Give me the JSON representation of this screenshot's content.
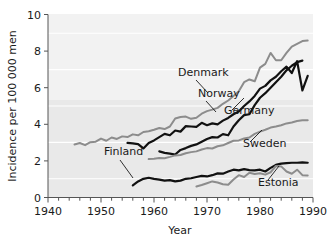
{
  "chart_data": {
    "type": "line",
    "title": "",
    "xlabel": "Year",
    "ylabel": "Incidence per 100 000 men",
    "xlim": [
      1940,
      1990
    ],
    "ylim": [
      0,
      10
    ],
    "xticks": [
      1940,
      1950,
      1960,
      1970,
      1980,
      1990
    ],
    "yticks": [
      0,
      2,
      4,
      6,
      8,
      10
    ],
    "xtick_labels": [
      "1940",
      "1950",
      "1960",
      "1970",
      "1980",
      "1990"
    ],
    "ytick_labels": [
      "0",
      "2",
      "4",
      "6",
      "8",
      "10"
    ],
    "xminor_step": 2,
    "grid": "horizontal-white-gridlines",
    "legend": "inline-labels-with-leader-lines",
    "series": [
      {
        "name": "Denmark",
        "color": "#8c8c8c",
        "label": "Denmark",
        "label_x": 178,
        "label_y": 76,
        "leader": [
          [
            196,
            80
          ],
          [
            208,
            93
          ]
        ],
        "points": [
          [
            1945,
            2.9
          ],
          [
            1946,
            2.98
          ],
          [
            1947,
            2.86
          ],
          [
            1948,
            3.02
          ],
          [
            1949,
            3.05
          ],
          [
            1950,
            3.22
          ],
          [
            1951,
            3.1
          ],
          [
            1952,
            3.28
          ],
          [
            1953,
            3.2
          ],
          [
            1954,
            3.34
          ],
          [
            1955,
            3.3
          ],
          [
            1956,
            3.45
          ],
          [
            1957,
            3.4
          ],
          [
            1958,
            3.58
          ],
          [
            1959,
            3.62
          ],
          [
            1960,
            3.7
          ],
          [
            1961,
            3.8
          ],
          [
            1962,
            3.74
          ],
          [
            1963,
            3.88
          ],
          [
            1964,
            4.32
          ],
          [
            1965,
            4.4
          ],
          [
            1966,
            4.42
          ],
          [
            1967,
            4.3
          ],
          [
            1968,
            4.36
          ],
          [
            1969,
            4.58
          ],
          [
            1970,
            4.72
          ],
          [
            1971,
            4.8
          ],
          [
            1972,
            4.9
          ],
          [
            1973,
            5.12
          ],
          [
            1974,
            5.3
          ],
          [
            1975,
            5.55
          ],
          [
            1976,
            5.8
          ],
          [
            1977,
            6.3
          ],
          [
            1978,
            6.45
          ],
          [
            1979,
            6.35
          ],
          [
            1980,
            7.1
          ],
          [
            1981,
            7.3
          ],
          [
            1982,
            7.9
          ],
          [
            1983,
            7.5
          ],
          [
            1984,
            7.5
          ],
          [
            1985,
            7.9
          ],
          [
            1986,
            8.25
          ],
          [
            1987,
            8.4
          ],
          [
            1988,
            8.55
          ],
          [
            1989,
            8.58
          ]
        ]
      },
      {
        "name": "Norway",
        "color": "#111111",
        "label": "Norway",
        "label_x": 198,
        "label_y": 97,
        "leader": [
          [
            206,
            101
          ],
          [
            216,
            112
          ]
        ],
        "points": [
          [
            1955,
            2.98
          ],
          [
            1956,
            2.96
          ],
          [
            1957,
            2.92
          ],
          [
            1958,
            2.68
          ],
          [
            1959,
            2.98
          ],
          [
            1960,
            3.12
          ],
          [
            1961,
            3.3
          ],
          [
            1962,
            3.48
          ],
          [
            1963,
            3.4
          ],
          [
            1964,
            3.66
          ],
          [
            1965,
            3.6
          ],
          [
            1966,
            3.9
          ],
          [
            1967,
            3.88
          ],
          [
            1968,
            3.86
          ],
          [
            1969,
            4.08
          ],
          [
            1970,
            3.95
          ],
          [
            1971,
            4.05
          ],
          [
            1972,
            4.0
          ],
          [
            1973,
            4.2
          ],
          [
            1974,
            4.35
          ],
          [
            1975,
            4.55
          ],
          [
            1976,
            4.7
          ],
          [
            1977,
            5.0
          ],
          [
            1978,
            5.25
          ],
          [
            1979,
            5.55
          ],
          [
            1980,
            5.95
          ],
          [
            1981,
            6.1
          ],
          [
            1982,
            6.4
          ],
          [
            1983,
            6.6
          ],
          [
            1984,
            6.9
          ],
          [
            1985,
            7.15
          ],
          [
            1986,
            6.8
          ],
          [
            1987,
            7.45
          ],
          [
            1988,
            5.85
          ],
          [
            1989,
            6.65
          ]
        ]
      },
      {
        "name": "Germany",
        "color": "#111111",
        "label": "Germany",
        "label_x": 224,
        "label_y": 114,
        "leader": [
          [
            232,
            110
          ],
          [
            244,
            98
          ]
        ],
        "points": [
          [
            1961,
            2.52
          ],
          [
            1962,
            2.44
          ],
          [
            1963,
            2.4
          ],
          [
            1964,
            2.35
          ],
          [
            1965,
            2.6
          ],
          [
            1966,
            2.7
          ],
          [
            1967,
            2.82
          ],
          [
            1968,
            2.9
          ],
          [
            1969,
            3.05
          ],
          [
            1970,
            3.2
          ],
          [
            1971,
            3.3
          ],
          [
            1972,
            3.28
          ],
          [
            1973,
            3.46
          ],
          [
            1974,
            3.4
          ],
          [
            1975,
            3.88
          ],
          [
            1976,
            4.22
          ],
          [
            1977,
            4.5
          ],
          [
            1978,
            4.55
          ],
          [
            1979,
            5.05
          ],
          [
            1980,
            5.45
          ],
          [
            1981,
            5.7
          ],
          [
            1982,
            6.0
          ],
          [
            1983,
            6.3
          ],
          [
            1984,
            6.6
          ],
          [
            1985,
            6.95
          ],
          [
            1986,
            7.2
          ],
          [
            1987,
            7.4
          ],
          [
            1988,
            7.48
          ]
        ]
      },
      {
        "name": "Finland",
        "color": "#111111",
        "label": "Finland",
        "label_x": 104,
        "label_y": 155,
        "leader": [
          [
            120,
            160
          ],
          [
            133,
            178
          ]
        ],
        "points": [
          [
            1956,
            0.66
          ],
          [
            1957,
            0.88
          ],
          [
            1958,
            1.02
          ],
          [
            1959,
            1.08
          ],
          [
            1960,
            1.02
          ],
          [
            1961,
            0.98
          ],
          [
            1962,
            0.92
          ],
          [
            1963,
            0.95
          ],
          [
            1964,
            0.88
          ],
          [
            1965,
            0.92
          ],
          [
            1966,
            1.02
          ],
          [
            1967,
            1.05
          ],
          [
            1968,
            1.12
          ],
          [
            1969,
            1.18
          ],
          [
            1970,
            1.15
          ],
          [
            1971,
            1.22
          ],
          [
            1972,
            1.32
          ],
          [
            1973,
            1.3
          ],
          [
            1974,
            1.42
          ],
          [
            1975,
            1.52
          ],
          [
            1976,
            1.48
          ],
          [
            1977,
            1.55
          ],
          [
            1978,
            1.5
          ],
          [
            1979,
            1.48
          ],
          [
            1980,
            1.52
          ],
          [
            1981,
            1.42
          ],
          [
            1982,
            1.62
          ],
          [
            1983,
            1.78
          ],
          [
            1984,
            1.85
          ],
          [
            1985,
            1.88
          ],
          [
            1986,
            1.9
          ],
          [
            1987,
            1.9
          ],
          [
            1988,
            1.92
          ],
          [
            1989,
            1.9
          ]
        ]
      },
      {
        "name": "Sweden",
        "color": "#8c8c8c",
        "label": "Sweden",
        "label_x": 243,
        "label_y": 147,
        "leader": [
          [
            250,
            142
          ],
          [
            262,
            130
          ]
        ],
        "points": [
          [
            1959,
            2.1
          ],
          [
            1960,
            2.12
          ],
          [
            1961,
            2.16
          ],
          [
            1962,
            2.15
          ],
          [
            1963,
            2.22
          ],
          [
            1964,
            2.3
          ],
          [
            1965,
            2.32
          ],
          [
            1966,
            2.42
          ],
          [
            1967,
            2.48
          ],
          [
            1968,
            2.52
          ],
          [
            1969,
            2.62
          ],
          [
            1970,
            2.7
          ],
          [
            1971,
            2.68
          ],
          [
            1972,
            2.8
          ],
          [
            1973,
            2.85
          ],
          [
            1974,
            2.98
          ],
          [
            1975,
            3.1
          ],
          [
            1976,
            3.12
          ],
          [
            1977,
            3.22
          ],
          [
            1978,
            3.28
          ],
          [
            1979,
            3.48
          ],
          [
            1980,
            3.6
          ],
          [
            1981,
            3.7
          ],
          [
            1982,
            3.82
          ],
          [
            1983,
            3.88
          ],
          [
            1984,
            3.95
          ],
          [
            1985,
            4.05
          ],
          [
            1986,
            4.1
          ],
          [
            1987,
            4.18
          ],
          [
            1988,
            4.22
          ],
          [
            1989,
            4.22
          ]
        ]
      },
      {
        "name": "Estonia",
        "color": "#8c8c8c",
        "label": "Estonia",
        "label_x": 258,
        "label_y": 186,
        "leader": [
          [
            268,
            180
          ],
          [
            279,
            166
          ]
        ],
        "points": [
          [
            1968,
            0.6
          ],
          [
            1969,
            0.68
          ],
          [
            1970,
            0.78
          ],
          [
            1971,
            0.88
          ],
          [
            1972,
            0.82
          ],
          [
            1973,
            0.72
          ],
          [
            1974,
            0.7
          ],
          [
            1975,
            0.98
          ],
          [
            1976,
            1.22
          ],
          [
            1977,
            1.12
          ],
          [
            1978,
            1.35
          ],
          [
            1979,
            1.28
          ],
          [
            1980,
            1.32
          ],
          [
            1981,
            1.25
          ],
          [
            1982,
            1.38
          ],
          [
            1983,
            1.72
          ],
          [
            1984,
            1.7
          ],
          [
            1985,
            1.42
          ],
          [
            1986,
            1.3
          ],
          [
            1987,
            1.52
          ],
          [
            1988,
            1.22
          ],
          [
            1989,
            1.2
          ]
        ]
      }
    ]
  },
  "colors": {
    "series_black": "#111111",
    "series_gray": "#8c8c8c",
    "plot_background": "#e9e9e9",
    "plot_background_top": "#f2f2f2",
    "gridline": "#ffffff",
    "axis": "#555555",
    "text": "#1a1a1a"
  }
}
